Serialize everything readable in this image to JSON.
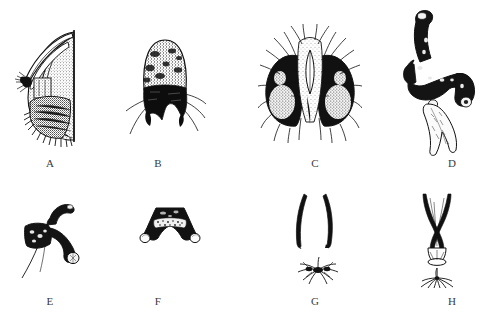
{
  "figure": {
    "kind": "scientific-illustration-plate",
    "background_color": "#ffffff",
    "ink_color": "#111111",
    "label_color": "#3a3a3a",
    "panel_count": 8,
    "rows": 2,
    "columns": 4
  },
  "panels": [
    {
      "id": "A",
      "label": "A",
      "label_x": 50,
      "label_y": 157,
      "subject": "lateral-genital-capsule-with-curved-claspers",
      "box": {
        "x": 12,
        "y": 20,
        "w": 88,
        "h": 128
      },
      "description": "Lateral view: elongate curved tapering claspers over a densely setose rounded lobe with straight vertical posterior margin"
    },
    {
      "id": "B",
      "label": "B",
      "label_x": 158,
      "label_y": 157,
      "subject": "dome-shaped-epandrium-with-bristles",
      "box": {
        "x": 124,
        "y": 28,
        "w": 82,
        "h": 115
      },
      "description": "Dorsal view: dome-shaped stippled plate with dark transverse band and long lateral bristles, bilobed ventral margin"
    },
    {
      "id": "C",
      "label": "C",
      "label_x": 315,
      "label_y": 157,
      "subject": "bilobed-hairy-surstyli-with-pale-median-lance",
      "box": {
        "x": 258,
        "y": 22,
        "w": 104,
        "h": 122
      },
      "description": "Posterior view: two dark setose lateral lobes flanking a pale median lanceolate aedeagal sclerite, fringed with long hairs"
    },
    {
      "id": "D",
      "label": "D",
      "label_x": 452,
      "label_y": 157,
      "subject": "hooked-aedeagal-complex-with-pale-forked-process",
      "box": {
        "x": 398,
        "y": 8,
        "w": 86,
        "h": 150
      },
      "description": "Lateral view: dark sinuous hook-shaped sclerite with knobbed arms and a pale elongate bifid ventral process"
    },
    {
      "id": "E",
      "label": "E",
      "label_x": 50,
      "label_y": 295,
      "subject": "small-hooked-sclerite-with-bristle",
      "box": {
        "x": 18,
        "y": 198,
        "w": 74,
        "h": 82
      },
      "description": "Dark blocky basal plate with recurved hook dorsally and a knobbed arm, bearing a long fine bristle"
    },
    {
      "id": "F",
      "label": "F",
      "label_x": 158,
      "label_y": 295,
      "subject": "trapezoid-hypandrium-with-paired-knobs",
      "box": {
        "x": 134,
        "y": 200,
        "w": 72,
        "h": 60
      },
      "description": "Dark trapezoidal plate with pale median stippled band and two rounded white knobs at the ventral corners"
    },
    {
      "id": "G",
      "label": "G",
      "label_x": 315,
      "label_y": 295,
      "subject": "paired-elongate-rods-and-spiny-comb",
      "box": {
        "x": 284,
        "y": 192,
        "w": 68,
        "h": 96
      },
      "description": "Upper: two long slender slightly bowed parenthesis-like rods. Lower: small transverse cluster of radiating spines"
    },
    {
      "id": "H",
      "label": "H",
      "label_x": 452,
      "label_y": 295,
      "subject": "crossed-rods-funnel-and-splayed-spine-cluster",
      "box": {
        "x": 404,
        "y": 192,
        "w": 66,
        "h": 96
      },
      "description": "Upper: crossed elongate rods converging into a narrow funnel with rounded basal ring. Lower: small splayed fan of spines on a stalk"
    }
  ]
}
